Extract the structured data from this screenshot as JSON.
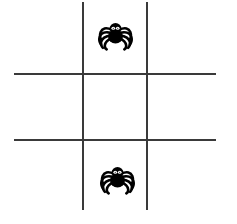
{
  "canvas": {
    "width": 237,
    "height": 224,
    "background_color": "#ffffff",
    "title": "Tic-tac-toe grid with spiders"
  },
  "grid": {
    "line_color": "#3a3a3a",
    "line_thickness": 2,
    "vertical_lines": [
      {
        "name": "vertical-line-left",
        "x": 82,
        "y": 2,
        "length": 208
      },
      {
        "name": "vertical-line-right",
        "x": 146,
        "y": 2,
        "length": 208
      }
    ],
    "horizontal_lines": [
      {
        "name": "horizontal-line-top",
        "y": 73,
        "x": 14,
        "length": 202
      },
      {
        "name": "horizontal-line-bottom",
        "y": 139,
        "x": 14,
        "length": 202
      }
    ]
  },
  "cells": [
    {
      "id": "cell-top-left",
      "row": 0,
      "col": 0,
      "content": ""
    },
    {
      "id": "cell-top-center",
      "row": 0,
      "col": 1,
      "content": "spider"
    },
    {
      "id": "cell-top-right",
      "row": 0,
      "col": 2,
      "content": ""
    },
    {
      "id": "cell-middle-left",
      "row": 1,
      "col": 0,
      "content": ""
    },
    {
      "id": "cell-middle-center",
      "row": 1,
      "col": 1,
      "content": ""
    },
    {
      "id": "cell-middle-right",
      "row": 1,
      "col": 2,
      "content": ""
    },
    {
      "id": "cell-bottom-left",
      "row": 2,
      "col": 0,
      "content": ""
    },
    {
      "id": "cell-bottom-center",
      "row": 2,
      "col": 1,
      "content": "spider"
    },
    {
      "id": "cell-bottom-right",
      "row": 2,
      "col": 2,
      "content": ""
    }
  ],
  "spiders": [
    {
      "name": "spider-icon-top",
      "cell": "cell-top-center",
      "x": 97,
      "y": 13,
      "width": 37,
      "height": 38,
      "body_color": "#000000",
      "eye_color": "#ffffff",
      "label": "spider"
    },
    {
      "name": "spider-icon-bottom",
      "cell": "cell-bottom-center",
      "x": 99,
      "y": 157,
      "width": 37,
      "height": 38,
      "body_color": "#000000",
      "eye_color": "#ffffff",
      "label": "spider"
    }
  ]
}
